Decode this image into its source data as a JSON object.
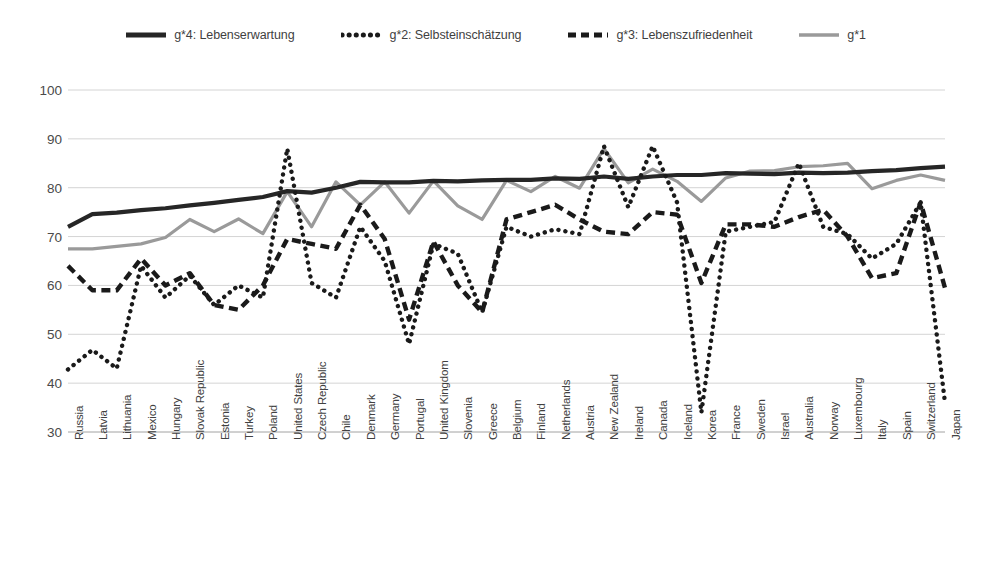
{
  "legend": {
    "items": [
      {
        "label": "g*4: Lebenserwartung",
        "style": "solid-thick",
        "color": "#262626",
        "icon": "legend-line-solid"
      },
      {
        "label": "g*2: Selbsteinschätzung",
        "style": "dotted",
        "color": "#1a1a1a",
        "icon": "legend-line-dotted"
      },
      {
        "label": "g*3: Lebenszufriedenheit",
        "style": "dashed",
        "color": "#1a1a1a",
        "icon": "legend-line-dashed"
      },
      {
        "label": "g*1",
        "style": "solid-gray",
        "color": "#9a9a9a",
        "icon": "legend-line-gray"
      }
    ]
  },
  "chart_data": {
    "type": "line",
    "title": "",
    "xlabel": "",
    "ylabel": "",
    "ylim": [
      30,
      100
    ],
    "y_ticks": [
      30,
      40,
      50,
      60,
      70,
      80,
      90,
      100
    ],
    "grid": true,
    "legend_position": "top",
    "categories": [
      "Russia",
      "Latvia",
      "Lithuania",
      "Mexico",
      "Hungary",
      "Slovak Republic",
      "Estonia",
      "Turkey",
      "Poland",
      "United States",
      "Czech Republic",
      "Chile",
      "Denmark",
      "Germany",
      "Portugal",
      "United Kingdom",
      "Slovenia",
      "Greece",
      "Belgium",
      "Finland",
      "Netherlands",
      "Austria",
      "New Zealand",
      "Ireland",
      "Canada",
      "Iceland",
      "Korea",
      "France",
      "Sweden",
      "Israel",
      "Australia",
      "Norway",
      "Luxembourg",
      "Italy",
      "Spain",
      "Switzerland",
      "Japan"
    ],
    "series": [
      {
        "name": "g*4: Lebenserwartung",
        "style": "solid-thick",
        "color": "#262626",
        "values": [
          72.0,
          74.6,
          74.9,
          75.4,
          75.8,
          76.4,
          76.9,
          77.5,
          78.1,
          79.3,
          79.0,
          80.0,
          81.2,
          81.1,
          81.1,
          81.4,
          81.3,
          81.5,
          81.6,
          81.6,
          81.9,
          81.8,
          82.3,
          81.8,
          82.3,
          82.6,
          82.6,
          83.0,
          82.9,
          82.8,
          83.1,
          83.0,
          83.1,
          83.4,
          83.6,
          84.0,
          84.3
        ]
      },
      {
        "name": "g*1",
        "style": "solid-gray",
        "color": "#9a9a9a",
        "values": [
          67.5,
          67.5,
          68.0,
          68.5,
          69.8,
          73.5,
          71.0,
          73.6,
          70.6,
          79.2,
          72.0,
          81.2,
          76.5,
          81.2,
          74.8,
          81.4,
          76.3,
          73.5,
          81.5,
          79.2,
          82.3,
          79.9,
          88.0,
          81.0,
          83.8,
          81.3,
          77.2,
          82.0,
          83.4,
          83.5,
          84.3,
          84.5,
          85.0,
          79.8,
          81.5,
          82.6,
          81.5
        ]
      },
      {
        "name": "g*3: Lebenszufriedenheit",
        "style": "dashed",
        "color": "#1a1a1a",
        "values": [
          64.0,
          59.0,
          59.0,
          65.5,
          60.0,
          62.5,
          56.0,
          55.0,
          60.0,
          69.5,
          68.5,
          67.5,
          76.5,
          69.5,
          53.0,
          69.0,
          60.0,
          54.5,
          73.5,
          75.0,
          76.5,
          73.5,
          71.0,
          70.5,
          75.0,
          74.5,
          60.5,
          72.5,
          72.5,
          72.0,
          74.0,
          75.5,
          70.0,
          61.5,
          62.5,
          77.0,
          59.5
        ]
      },
      {
        "name": "g*2: Selbsteinschätzung",
        "style": "dotted",
        "color": "#1a1a1a",
        "values": [
          42.8,
          46.8,
          43.0,
          64.0,
          57.5,
          62.0,
          56.0,
          60.0,
          57.5,
          88.0,
          60.5,
          57.5,
          72.0,
          65.0,
          48.0,
          68.5,
          66.5,
          54.5,
          72.0,
          70.0,
          71.5,
          70.5,
          88.5,
          76.0,
          88.5,
          77.0,
          34.0,
          71.0,
          72.0,
          73.0,
          85.0,
          72.0,
          70.5,
          65.5,
          68.5,
          77.0,
          36.0
        ]
      }
    ]
  }
}
